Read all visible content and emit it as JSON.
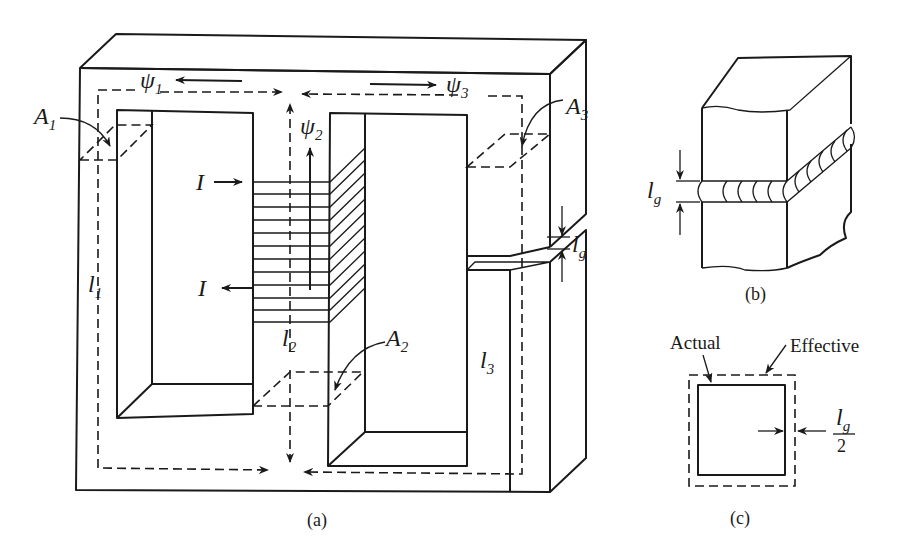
{
  "figure": {
    "panels": [
      {
        "id": "a",
        "caption": "(a)",
        "description": "Three-legged magnetic core with coil on center leg and air gap in right leg",
        "labels": {
          "psi1": {
            "sym": "ψ",
            "sub": "1"
          },
          "psi2": {
            "sym": "ψ",
            "sub": "2"
          },
          "psi3": {
            "sym": "ψ",
            "sub": "3"
          },
          "A1": {
            "sym": "A",
            "sub": "1"
          },
          "A2": {
            "sym": "A",
            "sub": "2"
          },
          "A3": {
            "sym": "A",
            "sub": "3"
          },
          "l1": {
            "sym": "l",
            "sub": "1"
          },
          "l2": {
            "sym": "l",
            "sub": "2"
          },
          "l3": {
            "sym": "l",
            "sub": "3"
          },
          "lg": {
            "sym": "l",
            "sub": "g"
          },
          "I_in": "I",
          "I_out": "I"
        }
      },
      {
        "id": "b",
        "caption": "(b)",
        "description": "Fringing flux at air gap of a core section",
        "labels": {
          "lg": {
            "sym": "l",
            "sub": "g"
          }
        }
      },
      {
        "id": "c",
        "caption": "(c)",
        "description": "Actual vs effective cross-section area",
        "labels": {
          "actual": "Actual",
          "effective": "Effective",
          "lg_half": {
            "num_sym": "l",
            "num_sub": "g",
            "den": "2"
          }
        }
      }
    ]
  }
}
